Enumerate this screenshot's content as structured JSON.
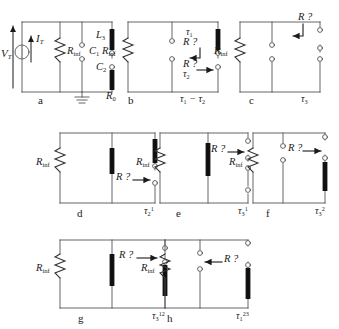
{
  "figure": {
    "type": "circuit-diagram-panels",
    "panel_count": 8,
    "background": "#ffffff",
    "wire_color": "#4a4a4a",
    "element_color": "#1a1a1a",
    "text_color": "#1a1a1a"
  },
  "panels": [
    {
      "id": "a",
      "letter": "a",
      "labels": {
        "source_voltage": "V",
        "source_voltage_sub": "T",
        "source_current": "I",
        "source_current_sub": "T",
        "resistor": "R",
        "resistor_sub": "inf",
        "cap1": "C",
        "cap1_sub": "1",
        "ind": "L",
        "ind_sub": "3",
        "cap2": "C",
        "cap2_sub": "2",
        "r0": "R",
        "r0_sub": "0"
      },
      "elements": [
        "current-source",
        "resistor-r-inf",
        "capacitor-c1",
        "inductor-l3",
        "capacitor-c2",
        "resistor-r0",
        "ground"
      ]
    },
    {
      "id": "b",
      "letter": "b",
      "labels": {
        "resistor": "R",
        "resistor_sub": "inf",
        "tau_top": "τ",
        "tau_top_sub": "1",
        "query_top": "R ?",
        "query_mid": "R ?",
        "query_mid_sub": "τ",
        "query_mid_sub2": "2",
        "bottom": "τ",
        "bottom_sub1": "1",
        "bottom_minus": " − ",
        "bottom_tau2": "τ",
        "bottom_sub2": "2"
      },
      "elements": [
        "resistor-r-inf",
        "open-terminal-pair",
        "black-bar",
        "arrow-down-left",
        "arrow-right"
      ]
    },
    {
      "id": "c",
      "letter": "c",
      "labels": {
        "resistor": "R",
        "resistor_sub": "inf",
        "query": "R ?",
        "tau": "τ",
        "tau_sub": "3"
      },
      "elements": [
        "resistor-r-inf",
        "open-terminal-pair",
        "open-terminal-pair-right",
        "arrow-down-left"
      ]
    },
    {
      "id": "d",
      "letter": "d",
      "labels": {
        "resistor": "R",
        "resistor_sub": "inf",
        "query": "R ?",
        "tau": "τ",
        "tau_sub": "2",
        "tau_sup": "1"
      },
      "elements": [
        "resistor-r-inf",
        "black-bar-middle",
        "black-bar-right",
        "open-terminal-pair",
        "arrow-right"
      ]
    },
    {
      "id": "e",
      "letter": "e",
      "labels": {
        "resistor": "R",
        "resistor_sub": "inf",
        "query": "R ?",
        "tau": "τ",
        "tau_sub": "3",
        "tau_sup": "1"
      },
      "elements": [
        "resistor-r-inf",
        "black-bar-middle",
        "open-terminal-pair-right",
        "arrow-right"
      ]
    },
    {
      "id": "f",
      "letter": "f",
      "labels": {
        "resistor": "R",
        "resistor_sub": "inf",
        "query": "R ?",
        "tau": "τ",
        "tau_sub": "3",
        "tau_sup": "2"
      },
      "elements": [
        "resistor-r-inf",
        "open-terminal-pair-middle",
        "black-bar-right",
        "arrow-right"
      ]
    },
    {
      "id": "g",
      "letter": "g",
      "labels": {
        "resistor": "R",
        "resistor_sub": "inf",
        "query": "R ?",
        "tau": "τ",
        "tau_sub": "3",
        "tau_sup": "12"
      },
      "elements": [
        "resistor-r-inf",
        "black-bar-middle",
        "black-bar-right",
        "open-terminal",
        "arrow-right"
      ]
    },
    {
      "id": "h",
      "letter": "h",
      "labels": {
        "resistor": "R",
        "resistor_sub": "inf",
        "query": "R ?",
        "tau": "τ",
        "tau_sub": "1",
        "tau_sup": "23"
      },
      "elements": [
        "resistor-r-inf",
        "open-terminal-pair-middle",
        "black-bar-right",
        "open-terminal",
        "arrow-left"
      ]
    }
  ]
}
